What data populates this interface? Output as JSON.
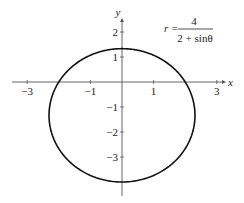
{
  "chart_data": {
    "type": "line",
    "title": "",
    "annotation": {
      "lhs": "r =",
      "numerator": "4",
      "denominator": "2 + sinθ"
    },
    "xlabel": "x",
    "ylabel": "y",
    "x_ticks": [
      -3,
      -1,
      1,
      3
    ],
    "x_tick_labels": [
      "−3",
      "−1",
      "1",
      "3"
    ],
    "y_ticks": [
      2,
      1,
      -1,
      -2,
      -3
    ],
    "y_tick_labels": [
      "2",
      "1",
      "−1",
      "−2",
      "−3"
    ],
    "xlim": [
      -3.3,
      3.3
    ],
    "ylim": [
      -4.5,
      2.6
    ],
    "grid": false,
    "series": [
      {
        "name": "r = 4/(2 + sinθ)",
        "kind": "ellipse",
        "center": [
          0,
          -1.333
        ],
        "semi_axis_x": 2.309,
        "semi_axis_y": 2.667,
        "points": [
          [
            0,
            1.333
          ],
          [
            2.0,
            0
          ],
          [
            2.309,
            -1.333
          ],
          [
            2.0,
            -2.667
          ],
          [
            0,
            -4
          ],
          [
            -2.0,
            -2.667
          ],
          [
            -2.309,
            -1.333
          ],
          [
            -2.0,
            0
          ]
        ]
      }
    ]
  },
  "layout": {
    "origin_px": [
      122,
      82
    ],
    "unit_x_px": 31.6,
    "unit_y_px": 25,
    "curve_color": "#111111",
    "axis_color": "#555555"
  }
}
